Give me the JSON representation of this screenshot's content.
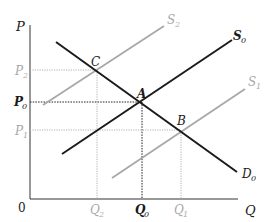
{
  "diagram": {
    "type": "supply-demand",
    "axes": {
      "y_label": "P",
      "x_label": "Q",
      "origin_label": "0"
    },
    "price_labels": [
      {
        "text": "P",
        "sub": "2",
        "color": "#a8a8a8"
      },
      {
        "text": "P",
        "sub": "0",
        "color": "#1a1a1a"
      },
      {
        "text": "P",
        "sub": "1",
        "color": "#a8a8a8"
      }
    ],
    "quantity_labels": [
      {
        "text": "Q",
        "sub": "2",
        "color": "#a8a8a8"
      },
      {
        "text": "Q",
        "sub": "0",
        "color": "#1a1a1a"
      },
      {
        "text": "Q",
        "sub": "1",
        "color": "#a8a8a8"
      }
    ],
    "curves": [
      {
        "name": "S",
        "sub": "2",
        "color": "#a8a8a8"
      },
      {
        "name": "S",
        "sub": "0",
        "color": "#1a1a1a"
      },
      {
        "name": "S",
        "sub": "1",
        "color": "#a8a8a8"
      },
      {
        "name": "D",
        "sub": "0",
        "color": "#1a1a1a"
      }
    ],
    "points": [
      "C",
      "A",
      "B"
    ],
    "colors": {
      "primary": "#1a1a1a",
      "shifted": "#a8a8a8",
      "guide": "#9a9a9a"
    }
  }
}
